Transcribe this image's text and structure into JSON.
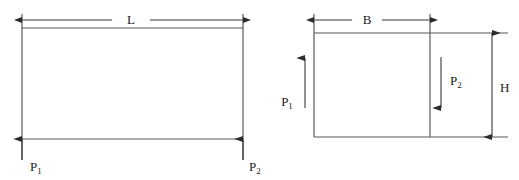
{
  "figure": {
    "type": "engineering-diagram",
    "background_color": "#ffffff",
    "line_color": "#595959",
    "annotation_color": "#2b2b2b",
    "panels": [
      {
        "id": "side-elevation",
        "name": "beam-side-elevation",
        "geometry": {
          "rect_left": 22,
          "rect_right": 243,
          "rect_top": 28,
          "rect_bottom": 139,
          "vertical_extension_top": 14,
          "vertical_extension_bottom": 160
        },
        "dimensions": [
          {
            "id": "span",
            "label": "L",
            "orientation": "horizontal",
            "arrowheads": "both",
            "y": 20,
            "x_start": 22,
            "x_end": 243,
            "label_x": 131,
            "label_y": 24
          }
        ],
        "loads": [
          {
            "id": "reaction-left",
            "label": "P",
            "subscript": "1",
            "direction": "up",
            "x": 22,
            "y_tail": 160,
            "y_head": 139,
            "label_x": 30,
            "label_y": 171
          },
          {
            "id": "reaction-right",
            "label": "P",
            "subscript": "2",
            "direction": "up",
            "x": 243,
            "y_tail": 160,
            "y_head": 139,
            "label_x": 249,
            "label_y": 171
          }
        ]
      },
      {
        "id": "cross-section",
        "name": "beam-cross-section",
        "geometry": {
          "rect_left": 314,
          "rect_right": 430,
          "rect_top": 33,
          "rect_bottom": 137,
          "horizontal_extension_right": 508,
          "vertical_extension_top": 14
        },
        "dimensions": [
          {
            "id": "width",
            "label": "B",
            "orientation": "horizontal",
            "arrowheads": "both",
            "y": 20,
            "x_start": 314,
            "x_end": 430,
            "label_x": 367,
            "label_y": 24
          },
          {
            "id": "height",
            "label": "H",
            "orientation": "vertical",
            "arrowheads": "both",
            "x": 492,
            "y_start": 33,
            "y_end": 137,
            "label_x": 500,
            "label_y": 92
          }
        ],
        "loads": [
          {
            "id": "load-left-up",
            "label": "P",
            "subscript": "1",
            "direction": "up",
            "x": 305,
            "y_tail": 108,
            "y_head": 58,
            "label_x": 287,
            "label_y": 106
          },
          {
            "id": "load-inner-down",
            "label": "P",
            "subscript": "2",
            "direction": "down",
            "x": 441,
            "y_tail": 57,
            "y_head": 108,
            "label_x": 450,
            "label_y": 85
          }
        ]
      }
    ]
  }
}
